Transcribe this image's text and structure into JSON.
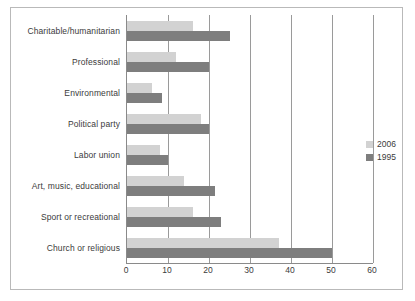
{
  "chart_data": {
    "type": "bar",
    "orientation": "horizontal",
    "title": "",
    "xlabel": "",
    "ylabel": "",
    "xlim": [
      0,
      60
    ],
    "xticks": [
      "0",
      "10",
      "20",
      "30",
      "40",
      "50",
      "60"
    ],
    "grid": true,
    "legend_position": "right",
    "categories": [
      "Charitable/humanitarian",
      "Professional",
      "Environmental",
      "Political party",
      "Labor union",
      "Art, music, educational",
      "Sport or recreational",
      "Church or religious"
    ],
    "series": [
      {
        "name": "2006",
        "color": "#d2d2d2",
        "values": [
          16,
          12,
          6,
          18,
          8,
          14,
          16,
          37
        ]
      },
      {
        "name": "1995",
        "color": "#7e7e7e",
        "values": [
          25,
          20,
          8.5,
          20,
          10,
          21.5,
          23,
          50
        ]
      }
    ]
  },
  "legend": {
    "entries": [
      {
        "label": "2006"
      },
      {
        "label": "1995"
      }
    ]
  }
}
